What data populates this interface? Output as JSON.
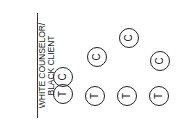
{
  "label": {
    "line1": "WHITE COUNSELOR/",
    "line2": "BLACK CLIENT"
  },
  "markers": [
    {
      "letter": "C",
      "x": 63,
      "y": 77
    },
    {
      "letter": "T",
      "x": 63,
      "y": 94
    },
    {
      "letter": "C",
      "x": 97,
      "y": 57
    },
    {
      "letter": "T",
      "x": 95,
      "y": 96
    },
    {
      "letter": "C",
      "x": 129,
      "y": 38
    },
    {
      "letter": "T",
      "x": 127,
      "y": 96
    },
    {
      "letter": "C",
      "x": 160,
      "y": 61
    },
    {
      "letter": "T",
      "x": 159,
      "y": 96
    }
  ]
}
